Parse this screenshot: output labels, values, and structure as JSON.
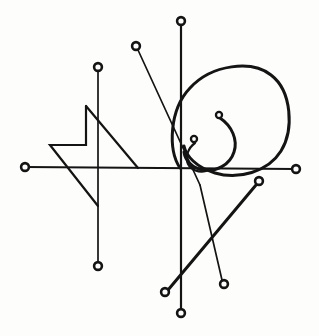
{
  "canvas": {
    "width": 319,
    "height": 336,
    "background_color": "#fdfdfb",
    "ink_color": "#141414"
  },
  "diagram": {
    "type": "occult-sigil-line-drawing",
    "center_point": {
      "x": 180,
      "y": 168
    },
    "stroke_widths": {
      "thin": 1.7,
      "medium": 2.2,
      "thick": 3.0
    },
    "terminal_circle": {
      "outer_radius": 5.2,
      "inner_radius": 2.6,
      "small_outer_radius": 4.2,
      "small_inner_radius": 1.9
    }
  },
  "strokes": [
    {
      "name": "horizontal-axis",
      "kind": "line",
      "weight": "medium",
      "x1": 25,
      "y1": 167,
      "x2": 295,
      "y2": 169
    },
    {
      "name": "vertical-axis",
      "kind": "line",
      "weight": "medium",
      "x1": 181,
      "y1": 26,
      "x2": 181,
      "y2": 308
    },
    {
      "name": "upper-left-diagonal",
      "kind": "line",
      "weight": "thin",
      "x1": 138,
      "y1": 50,
      "x2": 200,
      "y2": 185
    },
    {
      "name": "lower-center-diagonal",
      "kind": "line",
      "weight": "thin",
      "x1": 200,
      "y1": 185,
      "x2": 222,
      "y2": 280
    },
    {
      "name": "left-vertical-stem",
      "kind": "line",
      "weight": "thin",
      "x1": 98,
      "y1": 71,
      "x2": 98,
      "y2": 262
    },
    {
      "name": "lower-right-ascender",
      "kind": "line",
      "weight": "thick",
      "x1": 168,
      "y1": 290,
      "x2": 256,
      "y2": 185
    },
    {
      "name": "zigzag-bolt",
      "kind": "polyline",
      "weight": "medium",
      "points": "86,106 86,145 50,145 98,206"
    },
    {
      "name": "bolt-diagonal",
      "kind": "line",
      "weight": "medium",
      "x1": 86,
      "y1": 106,
      "x2": 138,
      "y2": 168
    },
    {
      "name": "great-circle",
      "kind": "path",
      "weight": "thick",
      "d": "M 180 168 C 168 150 169 110 190 88 C 212 64 252 60 271 75 C 292 91 294 130 281 151 C 268 172 238 180 215 173 C 196 167 186 156 184 146"
    },
    {
      "name": "inner-spiral-outer-turn",
      "kind": "path",
      "weight": "thick",
      "d": "M 220 118 C 232 126 238 140 234 152 C 230 165 216 172 203 170 C 192 168 185 160 184 152"
    },
    {
      "name": "inner-spiral-inner-turn",
      "kind": "path",
      "weight": "medium",
      "d": "M 195 143 C 188 148 185 157 188 164 C 191 170 199 173 206 171"
    }
  ],
  "terminals": [
    {
      "name": "terminal-left-axis",
      "x": 25,
      "y": 167,
      "size": "large"
    },
    {
      "name": "terminal-right-axis",
      "x": 296,
      "y": 169,
      "size": "large"
    },
    {
      "name": "terminal-top-axis",
      "x": 181,
      "y": 21,
      "size": "large"
    },
    {
      "name": "terminal-bottom-axis",
      "x": 181,
      "y": 313,
      "size": "large"
    },
    {
      "name": "terminal-upper-left-diagonal",
      "x": 136,
      "y": 46,
      "size": "large"
    },
    {
      "name": "terminal-left-stem-top",
      "x": 98,
      "y": 67,
      "size": "large"
    },
    {
      "name": "terminal-left-stem-bottom",
      "x": 98,
      "y": 266,
      "size": "large"
    },
    {
      "name": "terminal-lower-center-diagonal",
      "x": 224,
      "y": 284,
      "size": "large"
    },
    {
      "name": "terminal-lower-left-ascender",
      "x": 165,
      "y": 292,
      "size": "large"
    },
    {
      "name": "terminal-upper-right-ascender",
      "x": 259,
      "y": 181,
      "size": "large"
    },
    {
      "name": "terminal-spiral-outer",
      "x": 219,
      "y": 115,
      "size": "small"
    },
    {
      "name": "terminal-spiral-inner",
      "x": 194,
      "y": 139,
      "size": "small"
    }
  ]
}
